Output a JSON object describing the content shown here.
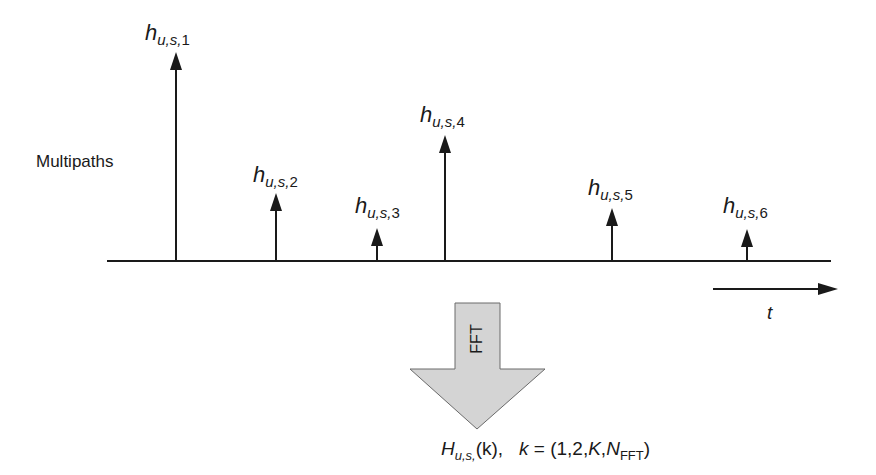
{
  "diagram": {
    "side_label": "Multipaths",
    "time_axis_label": "t",
    "transform_label": "FFT",
    "baseline": {
      "x1": 107,
      "x2": 831,
      "y": 261
    },
    "time_arrow": {
      "x1": 713,
      "x2": 836,
      "y": 289
    },
    "paths": [
      {
        "id": 1,
        "symbol": "h",
        "subscript": "u,s,",
        "index": "1",
        "x": 176,
        "tip_y": 52,
        "label_x": 145,
        "label_y": 22
      },
      {
        "id": 2,
        "symbol": "h",
        "subscript": "u,s,",
        "index": "2",
        "x": 276,
        "tip_y": 193,
        "label_x": 253,
        "label_y": 164
      },
      {
        "id": 3,
        "symbol": "h",
        "subscript": "u,s,",
        "index": "3",
        "x": 377,
        "tip_y": 228,
        "label_x": 355,
        "label_y": 195
      },
      {
        "id": 4,
        "symbol": "h",
        "subscript": "u,s,",
        "index": "4",
        "x": 445,
        "tip_y": 135,
        "label_x": 420,
        "label_y": 104
      },
      {
        "id": 5,
        "symbol": "h",
        "subscript": "u,s,",
        "index": "5",
        "x": 612,
        "tip_y": 208,
        "label_x": 588,
        "label_y": 177
      },
      {
        "id": 6,
        "symbol": "h",
        "subscript": "u,s,",
        "index": "6",
        "x": 747,
        "tip_y": 229,
        "label_x": 723,
        "label_y": 195
      }
    ],
    "formula": {
      "H": "H",
      "H_sub": "u,s,",
      "arg": "(k),",
      "k": "k",
      "equals": "= (1,2,",
      "K": "K",
      "comma": ",",
      "N": "N",
      "N_sub": "FFT",
      "close": ")"
    },
    "colors": {
      "line": "#1a1a1a",
      "fft_arrow_fill": "#d4d4d4",
      "fft_arrow_stroke": "#555555"
    }
  }
}
